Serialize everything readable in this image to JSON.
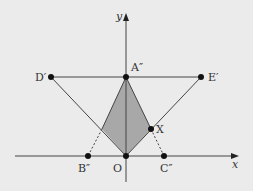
{
  "diagram": {
    "axes": {
      "x_label": "x",
      "y_label": "y"
    },
    "points": {
      "A": {
        "label": "A″"
      },
      "D": {
        "label": "D′"
      },
      "E": {
        "label": "E′"
      },
      "B": {
        "label": "B″"
      },
      "C": {
        "label": "C″"
      },
      "O": {
        "label": "O"
      },
      "X": {
        "label": "X"
      }
    },
    "colors": {
      "background": "#ebebeb",
      "line": "#444444",
      "shade": "#a8a8a8",
      "point": "#111111"
    }
  }
}
